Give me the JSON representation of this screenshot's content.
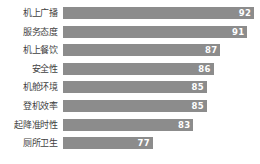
{
  "chart_data": {
    "type": "bar",
    "orientation": "horizontal",
    "title": "",
    "subtitle": "",
    "xlabel": "",
    "ylabel": "",
    "categories": [
      "机上广播",
      "服务态度",
      "机上餐饮",
      "安全性",
      "机舱环境",
      "登机效率",
      "起降准时性",
      "厕所卫生"
    ],
    "values": [
      92,
      91,
      87,
      86,
      85,
      85,
      83,
      77
    ],
    "value_labels": [
      "92",
      "91",
      "87",
      "86",
      "85",
      "85",
      "83",
      "77"
    ],
    "xlim": [
      63.7,
      92
    ],
    "axis_truncated": true,
    "grid": false,
    "legend": false,
    "legend_position": "none",
    "bar_color": "#8c8c8c",
    "value_label_color": "#ffffff",
    "category_label_color": "#3f3f3f",
    "background_color": "#ffffff",
    "series": [
      {
        "name": "满意度得分",
        "values": [
          92,
          91,
          87,
          86,
          85,
          85,
          83,
          77
        ]
      }
    ],
    "points": [
      {
        "category": "机上广播",
        "value": 92,
        "label": "92"
      },
      {
        "category": "服务态度",
        "value": 91,
        "label": "91"
      },
      {
        "category": "机上餐饮",
        "value": 87,
        "label": "87"
      },
      {
        "category": "安全性",
        "value": 86,
        "label": "86"
      },
      {
        "category": "机舱环境",
        "value": 85,
        "label": "85"
      },
      {
        "category": "登机效率",
        "value": 85,
        "label": "85"
      },
      {
        "category": "起降准时性",
        "value": 83,
        "label": "83"
      },
      {
        "category": "厕所卫生",
        "value": 77,
        "label": "77"
      }
    ]
  }
}
